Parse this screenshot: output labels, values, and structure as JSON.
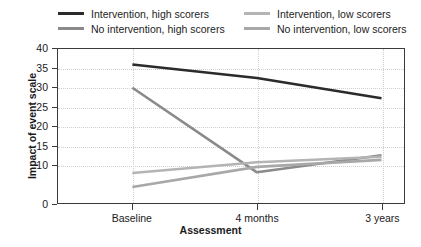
{
  "chart_data": {
    "type": "line",
    "title": "",
    "xlabel": "Assessment",
    "ylabel": "Impact of event scale",
    "categories": [
      "Baseline",
      "4 months",
      "3 years"
    ],
    "ylim": [
      0,
      40
    ],
    "ytick_labels": [
      "40",
      "35",
      "30",
      "25",
      "20",
      "15",
      "10",
      "0"
    ],
    "ytick_values": [
      40,
      35,
      30,
      25,
      20,
      15,
      10,
      0
    ],
    "grid": "horizontal and vertical dotted",
    "legend_position": "top",
    "series": [
      {
        "name": "Intervention, high scorers",
        "color": "#2b2b2b",
        "values": [
          36,
          32.5,
          27.3
        ]
      },
      {
        "name": "No intervention, high scorers",
        "color": "#8a8a8a",
        "values": [
          30,
          8.2,
          12.6
        ]
      },
      {
        "name": "Intervention, low scorers",
        "color": "#b4b4b4",
        "values": [
          8,
          10.8,
          12.2
        ]
      },
      {
        "name": "No intervention, low scorers",
        "color": "#a8a8a8",
        "values": [
          4.4,
          9.6,
          11.4
        ]
      }
    ]
  },
  "legend": {
    "items": [
      {
        "label": "Intervention, high scorers",
        "color": "#2b2b2b",
        "col": 0,
        "row": 0
      },
      {
        "label": "No intervention, high scorers",
        "color": "#8a8a8a",
        "col": 0,
        "row": 1
      },
      {
        "label": "Intervention, low scorers",
        "color": "#b4b4b4",
        "col": 1,
        "row": 0
      },
      {
        "label": "No intervention, low scorers",
        "color": "#a8a8a8",
        "col": 1,
        "row": 1
      }
    ]
  }
}
